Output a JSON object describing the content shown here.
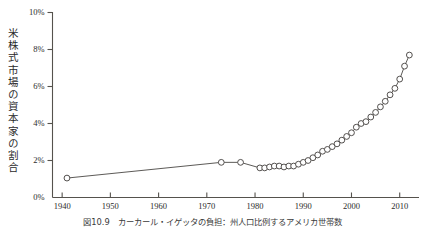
{
  "figure": {
    "ylabel": "米株式市場の資本家の割合",
    "caption": "図10.9　カーカール・イゲッタの負担：州人口比例するアメリカ世帯数",
    "axis_color": "#55524d",
    "marker_color": "#ffffff",
    "line_color": "#4a4744"
  },
  "chart_data": {
    "type": "line",
    "title": "",
    "xlabel": "",
    "ylabel": "米株式市場の資本家の割合",
    "xlim": [
      1938,
      2014
    ],
    "ylim": [
      0,
      10
    ],
    "grid": false,
    "legend": null,
    "y_ticks": [
      0,
      2,
      4,
      6,
      8,
      10
    ],
    "y_ticklabels": [
      "0%",
      "2%",
      "4%",
      "6%",
      "8%",
      "10%"
    ],
    "x_ticks": [
      1940,
      1950,
      1960,
      1970,
      1980,
      1990,
      2000,
      2010
    ],
    "x_ticklabels": [
      "1940",
      "1950",
      "1960",
      "1970",
      "1980",
      "1990",
      "2000",
      "2010"
    ],
    "series": [
      {
        "name": "米株式市場の資本家の割合",
        "marker": "open-circle",
        "x": [
          1941,
          1973,
          1977,
          1981,
          1982,
          1983,
          1984,
          1985,
          1986,
          1987,
          1988,
          1989,
          1990,
          1991,
          1992,
          1993,
          1994,
          1995,
          1996,
          1997,
          1998,
          1999,
          2000,
          2001,
          2002,
          2003,
          2004,
          2005,
          2006,
          2007,
          2008,
          2009,
          2010,
          2011,
          2012
        ],
        "y": [
          1.05,
          1.9,
          1.9,
          1.6,
          1.6,
          1.65,
          1.7,
          1.7,
          1.65,
          1.7,
          1.7,
          1.8,
          1.9,
          2.0,
          2.15,
          2.3,
          2.5,
          2.6,
          2.75,
          2.9,
          3.1,
          3.3,
          3.5,
          3.8,
          4.0,
          4.1,
          4.35,
          4.6,
          4.9,
          5.2,
          5.55,
          5.9,
          6.4,
          7.1,
          7.7
        ]
      }
    ]
  }
}
